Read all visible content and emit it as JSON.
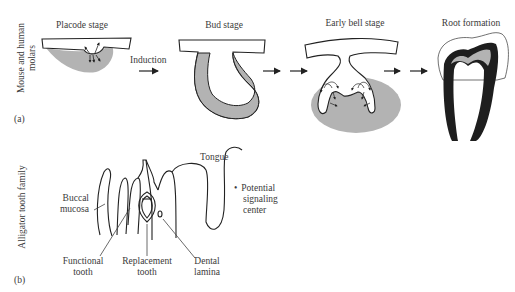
{
  "panel_a": {
    "label": "(a)",
    "row_label_line1": "Mouse and human",
    "row_label_line2": "molars",
    "stages": [
      {
        "label": "Placode stage"
      },
      {
        "label": "Bud stage"
      },
      {
        "label": "Early bell stage"
      },
      {
        "label": "Root formation"
      }
    ],
    "induction_label": "Induction"
  },
  "panel_b": {
    "label": "(b)",
    "row_label": "Alligator tooth family",
    "labels": {
      "tongue": "Tongue",
      "buccal_line1": "Buccal",
      "buccal_line2": "mucosa",
      "functional_line1": "Functional",
      "functional_line2": "tooth",
      "replacement_line1": "Replacement",
      "replacement_line2": "tooth",
      "dental_line1": "Dental",
      "dental_line2": "lamina"
    },
    "legend": {
      "bullet": "•",
      "line1": "Potential",
      "line2": "signaling",
      "line3": "center"
    }
  },
  "colors": {
    "mesenchyme_gray": "#b3b3b3",
    "epithelium_fill": "#ffffff",
    "outline": "#222222",
    "enamel_black": "#1e1e1e"
  }
}
